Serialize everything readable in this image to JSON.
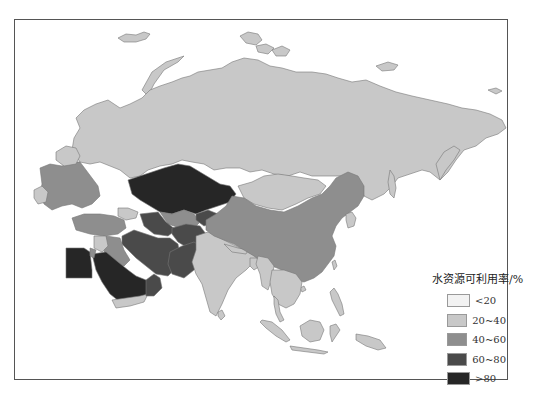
{
  "map": {
    "title": "",
    "region": "Asia / Eurasia",
    "colors": {
      "lt20": "#f2f2f2",
      "20_40": "#c8c8c8",
      "40_60": "#8e8e8e",
      "60_80": "#4a4a4a",
      "gt80": "#262626",
      "border": "#777777"
    }
  },
  "legend": {
    "title": "水资源可利用率/%",
    "items": [
      {
        "label": "<20",
        "color": "#f2f2f2"
      },
      {
        "label": "20~40",
        "color": "#c8c8c8"
      },
      {
        "label": "40~60",
        "color": "#8e8e8e"
      },
      {
        "label": "60~80",
        "color": "#4a4a4a"
      },
      {
        "label": ">80",
        "color": "#262626"
      }
    ]
  }
}
